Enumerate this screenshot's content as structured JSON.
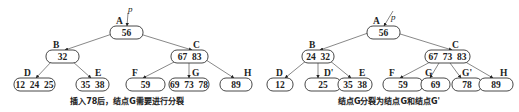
{
  "colors": {
    "stroke": "#333333",
    "text": "#222222",
    "edge": "#555555",
    "background": "#ffffff"
  },
  "pointer_label": "p",
  "diagrams": [
    {
      "id": "before-split",
      "caption": "插入78后，结点G需要进行分裂",
      "caption_pos": [
        127,
        104
      ],
      "pointer": {
        "from": [
          128,
          13
        ],
        "to": [
          127,
          26
        ],
        "label_pos": [
          128,
          12
        ]
      },
      "nodes": [
        {
          "id": "A",
          "label": "A",
          "keys": "56",
          "box": [
            110,
            26,
            33,
            13
          ],
          "label_pos": [
            116,
            24
          ]
        },
        {
          "id": "B",
          "label": "B",
          "keys": "32",
          "box": [
            46,
            50,
            33,
            13
          ],
          "label_pos": [
            53,
            48
          ]
        },
        {
          "id": "C",
          "label": "C",
          "keys": "67  83",
          "box": [
            171,
            50,
            37,
            13
          ],
          "label_pos": [
            193,
            48
          ]
        },
        {
          "id": "D",
          "label": "D",
          "keys": "12  24  25",
          "box": [
            14,
            78,
            41,
            13
          ],
          "label_pos": [
            24,
            76
          ]
        },
        {
          "id": "E",
          "label": "E",
          "keys": "35  38",
          "box": [
            76,
            78,
            33,
            13
          ],
          "label_pos": [
            95,
            76
          ]
        },
        {
          "id": "F",
          "label": "F",
          "keys": "59",
          "box": [
            126,
            78,
            39,
            13
          ],
          "label_pos": [
            132,
            76
          ]
        },
        {
          "id": "G",
          "label": "G",
          "keys": "69  73  78",
          "box": [
            169,
            78,
            40,
            13
          ],
          "label_pos": [
            192,
            76
          ]
        },
        {
          "id": "H",
          "label": "H",
          "keys": "89",
          "box": [
            220,
            78,
            32,
            13
          ],
          "label_pos": [
            244,
            76
          ]
        }
      ],
      "edges": [
        {
          "from": [
            112,
            34
          ],
          "to": [
            65,
            50
          ]
        },
        {
          "from": [
            140,
            34
          ],
          "to": [
            192,
            50
          ]
        },
        {
          "from": [
            52,
            61
          ],
          "to": [
            36,
            78
          ]
        },
        {
          "from": [
            72,
            61
          ],
          "to": [
            91,
            78
          ]
        },
        {
          "from": [
            178,
            60
          ],
          "to": [
            143,
            78
          ]
        },
        {
          "from": [
            189,
            63
          ],
          "to": [
            189,
            78
          ]
        },
        {
          "from": [
            203,
            58
          ],
          "to": [
            234,
            78
          ]
        }
      ]
    },
    {
      "id": "after-split",
      "caption": "结点G分裂为结点G和结点G'",
      "caption_pos": [
        389,
        104
      ],
      "pointer": {
        "from": [
          393,
          11
        ],
        "to": [
          384,
          26
        ],
        "label_pos": [
          391,
          20
        ]
      },
      "nodes": [
        {
          "id": "A",
          "label": "A",
          "keys": "56",
          "box": [
            367,
            26,
            33,
            13
          ],
          "label_pos": [
            373,
            24
          ]
        },
        {
          "id": "B",
          "label": "B",
          "keys": "24  32",
          "box": [
            302,
            50,
            32,
            13
          ],
          "label_pos": [
            309,
            48
          ]
        },
        {
          "id": "C",
          "label": "C",
          "keys": "67  73  83",
          "box": [
            425,
            50,
            45,
            13
          ],
          "label_pos": [
            452,
            48
          ]
        },
        {
          "id": "D",
          "label": "D",
          "keys": "12",
          "box": [
            267,
            78,
            26,
            13
          ],
          "label_pos": [
            276,
            76
          ]
        },
        {
          "id": "D2",
          "label": "D'",
          "keys": "25",
          "box": [
            305,
            78,
            36,
            13
          ],
          "label_pos": [
            324,
            76
          ]
        },
        {
          "id": "E",
          "label": "E",
          "keys": "35  38",
          "box": [
            338,
            78,
            34,
            13
          ],
          "label_pos": [
            359,
            76
          ]
        },
        {
          "id": "F",
          "label": "F",
          "keys": "59",
          "box": [
            383,
            78,
            40,
            13
          ],
          "label_pos": [
            389,
            76
          ]
        },
        {
          "id": "G",
          "label": "G",
          "keys": "69",
          "box": [
            421,
            78,
            29,
            13
          ],
          "label_pos": [
            425,
            76
          ]
        },
        {
          "id": "G2",
          "label": "G'",
          "keys": "78",
          "box": [
            452,
            78,
            30,
            13
          ],
          "label_pos": [
            462,
            76
          ]
        },
        {
          "id": "H",
          "label": "H",
          "keys": "89",
          "box": [
            479,
            78,
            34,
            13
          ],
          "label_pos": [
            500,
            76
          ]
        }
      ],
      "edges": [
        {
          "from": [
            368,
            33
          ],
          "to": [
            320,
            50
          ]
        },
        {
          "from": [
            397,
            33
          ],
          "to": [
            452,
            50
          ]
        },
        {
          "from": [
            307,
            60
          ],
          "to": [
            285,
            78
          ]
        },
        {
          "from": [
            318,
            63
          ],
          "to": [
            318,
            78
          ]
        },
        {
          "from": [
            329,
            60
          ],
          "to": [
            351,
            78
          ]
        },
        {
          "from": [
            434,
            60
          ],
          "to": [
            400,
            78
          ]
        },
        {
          "from": [
            439,
            63
          ],
          "to": [
            430,
            78
          ]
        },
        {
          "from": [
            450,
            63
          ],
          "to": [
            461,
            78
          ]
        },
        {
          "from": [
            462,
            60
          ],
          "to": [
            493,
            78
          ]
        }
      ]
    }
  ]
}
